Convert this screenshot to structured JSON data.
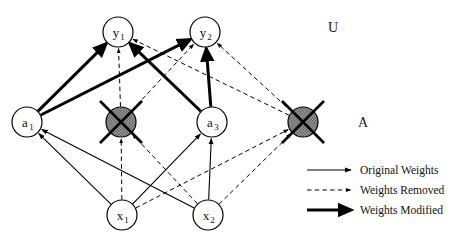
{
  "figure": {
    "type": "neural-network-pruning-diagram",
    "background_color": "#ffffff",
    "ink_color": "#000000",
    "removed_node_fill": "#8c8c8c"
  },
  "layer_labels": {
    "output_layer": "U",
    "hidden_layer": "A"
  },
  "nodes": {
    "output": [
      {
        "id": "y1",
        "base": "y",
        "sub": "1",
        "cx": 118,
        "cy": 32,
        "r": 15,
        "state": "active"
      },
      {
        "id": "y2",
        "base": "y",
        "sub": "2",
        "cx": 205,
        "cy": 32,
        "r": 15,
        "state": "active"
      }
    ],
    "hidden": [
      {
        "id": "a1",
        "base": "a",
        "sub": "1",
        "cx": 27,
        "cy": 122,
        "r": 15,
        "state": "active"
      },
      {
        "id": "a2",
        "base": "",
        "sub": "",
        "cx": 121,
        "cy": 122,
        "r": 15,
        "state": "removed"
      },
      {
        "id": "a3",
        "base": "a",
        "sub": "3",
        "cx": 212,
        "cy": 122,
        "r": 15,
        "state": "active"
      },
      {
        "id": "a4",
        "base": "",
        "sub": "",
        "cx": 303,
        "cy": 122,
        "r": 15,
        "state": "removed"
      }
    ],
    "input": [
      {
        "id": "x1",
        "base": "x",
        "sub": "1",
        "cx": 122,
        "cy": 215,
        "r": 15,
        "state": "active"
      },
      {
        "id": "x2",
        "base": "x",
        "sub": "2",
        "cx": 208,
        "cy": 215,
        "r": 15,
        "state": "active"
      }
    ]
  },
  "edges": [
    {
      "from": "a1",
      "to": "y1",
      "style": "modified"
    },
    {
      "from": "a1",
      "to": "y2",
      "style": "modified"
    },
    {
      "from": "a2",
      "to": "y1",
      "style": "removed"
    },
    {
      "from": "a2",
      "to": "y2",
      "style": "removed"
    },
    {
      "from": "a3",
      "to": "y1",
      "style": "modified"
    },
    {
      "from": "a3",
      "to": "y2",
      "style": "modified"
    },
    {
      "from": "a4",
      "to": "y1",
      "style": "removed"
    },
    {
      "from": "a4",
      "to": "y2",
      "style": "removed"
    },
    {
      "from": "x1",
      "to": "a1",
      "style": "original"
    },
    {
      "from": "x1",
      "to": "a2",
      "style": "removed"
    },
    {
      "from": "x1",
      "to": "a3",
      "style": "original"
    },
    {
      "from": "x1",
      "to": "a4",
      "style": "removed"
    },
    {
      "from": "x2",
      "to": "a1",
      "style": "original"
    },
    {
      "from": "x2",
      "to": "a2",
      "style": "removed"
    },
    {
      "from": "x2",
      "to": "a3",
      "style": "original"
    },
    {
      "from": "x2",
      "to": "a4",
      "style": "removed"
    }
  ],
  "legend": {
    "items": [
      {
        "key": "original",
        "label": "Original Weights",
        "style": "thin-solid-arrow"
      },
      {
        "key": "removed",
        "label": "Weights Removed",
        "style": "dashed-arrow"
      },
      {
        "key": "modified",
        "label": "Weights Modified",
        "style": "thick-solid-arrow"
      }
    ],
    "sample_x1": 307,
    "sample_x2": 351,
    "text_x": 360,
    "rows_y": [
      170,
      190,
      210
    ]
  }
}
